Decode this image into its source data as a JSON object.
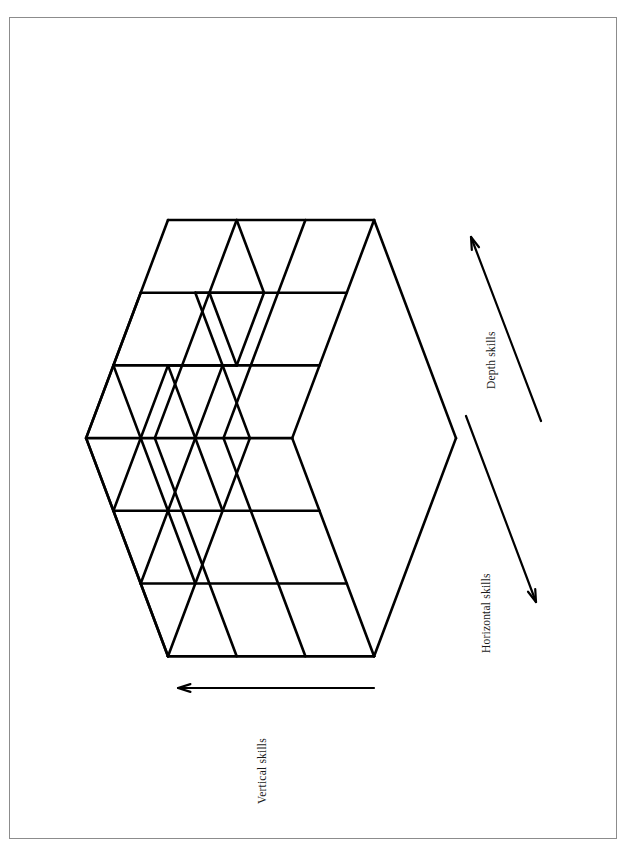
{
  "page": {
    "background_color": "#ffffff",
    "frame_color": "#8c8c8c",
    "line_color": "#000000",
    "orientation": "landscape-content-rotated-90"
  },
  "figure": {
    "kind": "isometric-cube-diagram",
    "grid_divisions": 3,
    "removed_corner_cube": true,
    "axes": [
      {
        "id": "vertical",
        "label": "Vertical skills",
        "arrow_direction": "leftward-horizontal",
        "arrow_from": [
          374,
          688
        ],
        "arrow_to": [
          178,
          688
        ]
      },
      {
        "id": "horizontal",
        "label": "Horizontal skills",
        "arrow_direction": "down-right",
        "arrow_from": [
          466,
          416
        ],
        "arrow_to": [
          536,
          602
        ]
      },
      {
        "id": "depth",
        "label": "Depth skills",
        "arrow_direction": "up-left",
        "arrow_from": [
          541,
          421
        ],
        "arrow_to": [
          471,
          237
        ]
      }
    ],
    "vertices": {
      "top": [
        168,
        220
      ],
      "top_right": [
        374,
        220
      ],
      "right_mid": [
        456,
        438
      ],
      "bottom_right": [
        374,
        655
      ],
      "bottom": [
        168,
        655
      ],
      "left_mid": [
        87,
        438
      ]
    },
    "basis_vectors": {
      "a_horizontal_right": [
        68.7,
        0
      ],
      "b_down_right": [
        27.3,
        72.7
      ],
      "c_down_left": [
        -27.3,
        72.7
      ]
    }
  },
  "labels": {
    "vertical_skills": "Vertical skills",
    "horizontal_skills": "Horizontal skills",
    "depth_skills": "Depth skills"
  },
  "caption": ""
}
